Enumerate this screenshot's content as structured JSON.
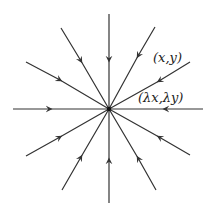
{
  "diagram": {
    "center": [
      109,
      109
    ],
    "ray_count": 12,
    "arrow_direction": "toward-center",
    "stroke_color": "#333333",
    "labels": {
      "point": "(x,y)",
      "scaled_point": "(λx,λy)"
    }
  }
}
